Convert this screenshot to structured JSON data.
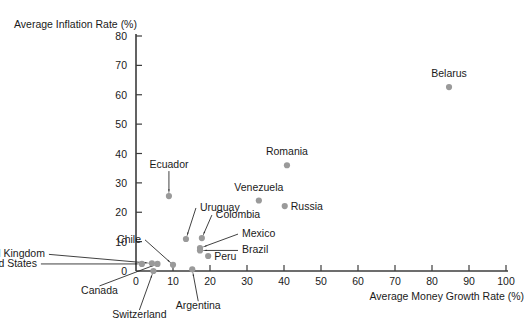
{
  "chart_data": {
    "type": "scatter",
    "title": "",
    "xlabel": "Average Money Growth Rate (%)",
    "ylabel": "Average Inflation Rate (%)",
    "xlim": [
      0,
      100
    ],
    "ylim": [
      0,
      80
    ],
    "xticks": [
      0,
      10,
      20,
      30,
      40,
      50,
      60,
      70,
      80,
      90,
      100
    ],
    "yticks": [
      0,
      10,
      20,
      30,
      40,
      50,
      60,
      70,
      80
    ],
    "grid": false,
    "legend": "none",
    "point_color": "#9a9a9a",
    "axis_color": "#3c3c3c",
    "points": [
      {
        "label": "Belarus",
        "x": 84.6,
        "y": 62.6,
        "label_dx": 0,
        "label_dy": -10,
        "anchor": "middle",
        "leader": false
      },
      {
        "label": "Romania",
        "x": 40.8,
        "y": 36.0,
        "label_dx": 0,
        "label_dy": -10,
        "anchor": "middle",
        "leader": false
      },
      {
        "label": "Venezuela",
        "x": 33.2,
        "y": 24.0,
        "label_dx": 0,
        "label_dy": -10,
        "anchor": "middle",
        "leader": false
      },
      {
        "label": "Russia",
        "x": 40.2,
        "y": 22.1,
        "label_dx": 6,
        "label_dy": 3.5,
        "anchor": "start",
        "leader": false
      },
      {
        "label": "Peru",
        "x": 19.5,
        "y": 5.1,
        "label_dx": 6,
        "label_dy": 3.5,
        "anchor": "start",
        "leader": false
      },
      {
        "label": "Ecuador",
        "x": 8.9,
        "y": 25.5,
        "label_dx": 0,
        "label_dy": -28,
        "anchor": "middle",
        "leader": true
      },
      {
        "label": "Uruguay",
        "x": 13.5,
        "y": 10.9,
        "label_dx": 14,
        "label_dy": -28,
        "anchor": "start",
        "leader": true
      },
      {
        "label": "Colombia",
        "x": 17.8,
        "y": 11.2,
        "label_dx": 14,
        "label_dy": -20,
        "anchor": "start",
        "leader": true
      },
      {
        "label": "Mexico",
        "x": 17.3,
        "y": 7.8,
        "label_dx": 42,
        "label_dy": -11,
        "anchor": "start",
        "leader": true
      },
      {
        "label": "Brazil",
        "x": 17.3,
        "y": 7.0,
        "label_dx": 42,
        "label_dy": 3,
        "anchor": "start",
        "leader": true
      },
      {
        "label": "Chile",
        "x": 10.0,
        "y": 2.1,
        "label_dx": -32,
        "label_dy": -22,
        "anchor": "end",
        "leader": true
      },
      {
        "label": "United Kingdom",
        "x": 4.3,
        "y": 2.6,
        "label_dx": -107,
        "label_dy": -6,
        "anchor": "end",
        "leader": true
      },
      {
        "label": "United States",
        "x": 1.6,
        "y": 2.4,
        "label_dx": -105,
        "label_dy": 3,
        "anchor": "end",
        "leader": true
      },
      {
        "label": "Canada",
        "x": 5.8,
        "y": 2.4,
        "label_dx": -58,
        "label_dy": 30,
        "anchor": "middle",
        "leader": true
      },
      {
        "label": "Switzerland",
        "x": 4.7,
        "y": 0.0,
        "label_dx": -14,
        "label_dy": 47,
        "anchor": "middle",
        "leader": true
      },
      {
        "label": "Argentina",
        "x": 15.2,
        "y": 0.6,
        "label_dx": 6,
        "label_dy": 40,
        "anchor": "middle",
        "leader": true
      }
    ]
  },
  "axes": {
    "x_title": "Average Money Growth Rate (%)",
    "y_title": "Average Inflation Rate (%)",
    "x_tick_labels": [
      "0",
      "10",
      "20",
      "30",
      "40",
      "50",
      "60",
      "70",
      "80",
      "90",
      "100"
    ],
    "y_tick_labels": [
      "0",
      "10",
      "20",
      "30",
      "40",
      "50",
      "60",
      "70",
      "80"
    ]
  }
}
